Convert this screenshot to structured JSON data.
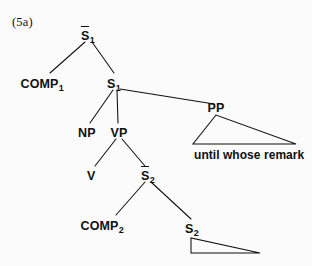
{
  "figure": {
    "example_number": "(5a)",
    "type": "syntax-tree",
    "ink_color": "#101010",
    "background_color": "#fbfbfb"
  },
  "nodes": {
    "sbar1": {
      "label": "S",
      "subscript": "1",
      "overbar": true,
      "x": 88,
      "y": 36
    },
    "comp1": {
      "label": "COMP",
      "subscript": "1",
      "overbar": false,
      "x": 42,
      "y": 84
    },
    "s1": {
      "label": "S",
      "subscript": "1",
      "overbar": false,
      "x": 114,
      "y": 84
    },
    "np": {
      "label": "NP",
      "subscript": "",
      "overbar": false,
      "x": 87,
      "y": 133
    },
    "vp": {
      "label": "VP",
      "subscript": "",
      "overbar": false,
      "x": 119,
      "y": 133
    },
    "pp": {
      "label": "PP",
      "subscript": "",
      "overbar": false,
      "x": 216,
      "y": 108
    },
    "v": {
      "label": "V",
      "subscript": "",
      "overbar": false,
      "x": 91,
      "y": 176
    },
    "sbar2": {
      "label": "S",
      "subscript": "2",
      "overbar": true,
      "x": 148,
      "y": 176
    },
    "comp2": {
      "label": "COMP",
      "subscript": "2",
      "overbar": false,
      "x": 102,
      "y": 226
    },
    "s2": {
      "label": "S",
      "subscript": "2",
      "overbar": false,
      "x": 192,
      "y": 229
    }
  },
  "terminals": {
    "pp_string": {
      "text": "until whose remark",
      "x": 194,
      "y": 148
    },
    "s2_string": {
      "text": "",
      "x": 0,
      "y": 0
    }
  },
  "edges": [
    {
      "name": "sbar1-comp1",
      "from": "sbar1",
      "to": "comp1",
      "x1": 85,
      "y1": 42,
      "x2": 50,
      "y2": 73
    },
    {
      "name": "sbar1-s1",
      "from": "sbar1",
      "to": "s1",
      "x1": 92,
      "y1": 42,
      "x2": 114,
      "y2": 73
    },
    {
      "name": "s1-np",
      "from": "s1",
      "to": "np",
      "x1": 113,
      "y1": 90,
      "x2": 90,
      "y2": 123
    },
    {
      "name": "s1-vp",
      "from": "s1",
      "to": "vp",
      "x1": 117,
      "y1": 90,
      "x2": 118,
      "y2": 123
    },
    {
      "name": "s1-pp",
      "from": "s1",
      "to": "pp",
      "x1": 120,
      "y1": 89,
      "x2": 214,
      "y2": 104
    },
    {
      "name": "vp-v",
      "from": "vp",
      "to": "v",
      "x1": 116,
      "y1": 139,
      "x2": 95,
      "y2": 166
    },
    {
      "name": "vp-sbar2",
      "from": "vp",
      "to": "sbar2",
      "x1": 122,
      "y1": 139,
      "x2": 145,
      "y2": 166
    },
    {
      "name": "sbar2-comp2",
      "from": "sbar2",
      "to": "comp2",
      "x1": 145,
      "y1": 182,
      "x2": 116,
      "y2": 215
    },
    {
      "name": "sbar2-s2",
      "from": "sbar2",
      "to": "s2",
      "x1": 151,
      "y1": 182,
      "x2": 191,
      "y2": 219
    }
  ],
  "triangles": [
    {
      "name": "pp-triangle",
      "parent": "pp",
      "apex_x": 216,
      "apex_y": 115,
      "left_x": 193,
      "left_y": 144,
      "right_x": 296,
      "right_y": 144
    },
    {
      "name": "s2-triangle",
      "parent": "s2",
      "apex_x": 191,
      "apex_y": 238,
      "left_x": 191,
      "left_y": 253,
      "right_x": 260,
      "right_y": 253
    }
  ]
}
